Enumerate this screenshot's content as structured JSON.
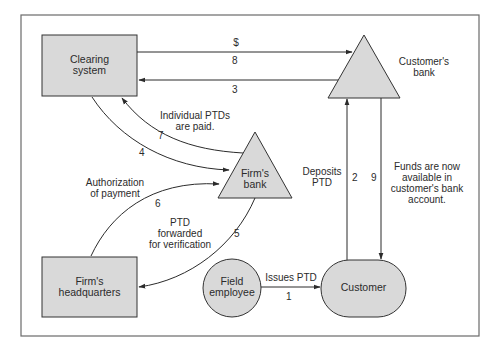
{
  "colors": {
    "shape_fill": "#d9d9d9",
    "stroke": "#2b2b2b",
    "frame": "#666666",
    "background": "#ffffff"
  },
  "nodes": {
    "clearing_system": {
      "label_line1": "Clearing",
      "label_line2": "system",
      "shape": "rectangle"
    },
    "customers_bank": {
      "label_line1": "Customer's",
      "label_line2": "bank",
      "shape": "triangle"
    },
    "firms_bank": {
      "label_line1": "Firm's",
      "label_line2": "bank",
      "shape": "triangle"
    },
    "firms_headquarters": {
      "label_line1": "Firm's",
      "label_line2": "headquarters",
      "shape": "rectangle"
    },
    "field_employee": {
      "label_line1": "Field",
      "label_line2": "employee",
      "shape": "circle"
    },
    "customer": {
      "label": "Customer",
      "shape": "stadium"
    }
  },
  "flows": [
    {
      "step": "1",
      "from": "Field employee",
      "to": "Customer",
      "label": "Issues PTD"
    },
    {
      "step": "2",
      "from": "Customer",
      "to": "Customer's bank",
      "label_line1": "Deposits",
      "label_line2": "PTD"
    },
    {
      "step": "3",
      "from": "Customer's bank",
      "to": "Clearing system",
      "label": ""
    },
    {
      "step": "4",
      "from": "Clearing system",
      "to": "Firm's bank",
      "label": ""
    },
    {
      "step": "5",
      "from": "Firm's bank",
      "to": "Firm's headquarters",
      "label_line1": "PTD",
      "label_line2": "forwarded",
      "label_line3": "for verification"
    },
    {
      "step": "6",
      "from": "Firm's headquarters",
      "to": "Firm's bank",
      "label_line1": "Authorization",
      "label_line2": "of payment"
    },
    {
      "step": "7",
      "from": "Firm's bank",
      "to": "Clearing system",
      "label_line1": "Individual PTDs",
      "label_line2": "are paid."
    },
    {
      "step": "8",
      "from": "Clearing system",
      "to": "Customer's bank",
      "label": "$"
    },
    {
      "step": "9",
      "from": "Customer's bank",
      "to": "Customer",
      "label_line1": "Funds are now",
      "label_line2": "available in",
      "label_line3": "customer's bank",
      "label_line4": "account."
    }
  ]
}
